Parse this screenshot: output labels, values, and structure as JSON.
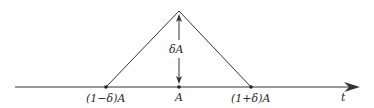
{
  "diagram": {
    "type": "triangular-pulse",
    "colors": {
      "line": "#333333",
      "background": "#ffffff"
    },
    "axis": {
      "label": "t"
    },
    "points": [
      {
        "id": "left",
        "label": "(1−δ)A"
      },
      {
        "id": "center",
        "label": "A"
      },
      {
        "id": "right",
        "label": "(1+δ)A"
      }
    ],
    "height_label": "δA"
  }
}
